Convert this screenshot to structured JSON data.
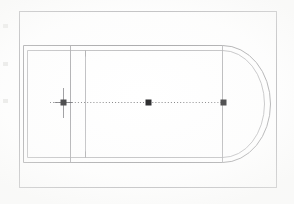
{
  "document": {
    "kind": "scanned-plan-drawing",
    "title": "Apsidal building plan",
    "background_color": "#ffffff",
    "paper_color": "#fcfcfb",
    "ink_color": "#8a8a8c",
    "ink_color_light": "#b8b8ba",
    "ink_color_dark": "#2b2b2b",
    "width": 294,
    "height": 204
  },
  "frame": {
    "name": "drawing-border",
    "x": 19,
    "y": 11,
    "width": 258,
    "height": 177,
    "stroke": "#a9a9ac",
    "stroke_width": 1
  },
  "plan": {
    "label": "apsidal-structure",
    "outer_wall": {
      "x": 23,
      "y": 45,
      "right_junction": 222,
      "bottom": 162,
      "stroke": "#8e8e91"
    },
    "inner_wall": {
      "x": 27,
      "y": 50,
      "right_junction": 222,
      "bottom": 157,
      "stroke": "#9a9a9d"
    },
    "cross_walls": [
      {
        "name": "cross-wall-outer",
        "x": 70,
        "top": 45,
        "bottom": 162
      },
      {
        "name": "cross-wall-inner",
        "x": 85,
        "top": 50,
        "bottom": 157
      }
    ],
    "apse": {
      "name": "apse-semicircle",
      "junction_x": 222,
      "center_y": 103,
      "outer_radius_x": 48,
      "outer_radius_y": 59,
      "inner_radius_x": 42,
      "inner_radius_y": 53,
      "stroke": "#8e8e91"
    },
    "axis_line": {
      "name": "center-axis",
      "y": 102,
      "x_start": 50,
      "x_end": 226,
      "style": "dotted",
      "stroke": "#6f6f72"
    },
    "survey_points": [
      {
        "name": "survey-point-west",
        "x": 63,
        "y": 102,
        "has_crosshair": true,
        "size": 5
      },
      {
        "name": "survey-point-center",
        "x": 148,
        "y": 102,
        "has_crosshair": false,
        "size": 5
      },
      {
        "name": "survey-point-east",
        "x": 223,
        "y": 102,
        "has_crosshair": false,
        "size": 5
      }
    ]
  },
  "scan_artifacts": {
    "edge_marks": [
      {
        "name": "edge-mark-top",
        "x": 3,
        "y": 24,
        "width": 5,
        "height": 4
      },
      {
        "name": "edge-mark-middle",
        "x": 3,
        "y": 62,
        "width": 5,
        "height": 4
      },
      {
        "name": "edge-mark-bottom",
        "x": 3,
        "y": 99,
        "width": 5,
        "height": 4
      }
    ],
    "edge_mark_color": "#e2e2e0"
  }
}
